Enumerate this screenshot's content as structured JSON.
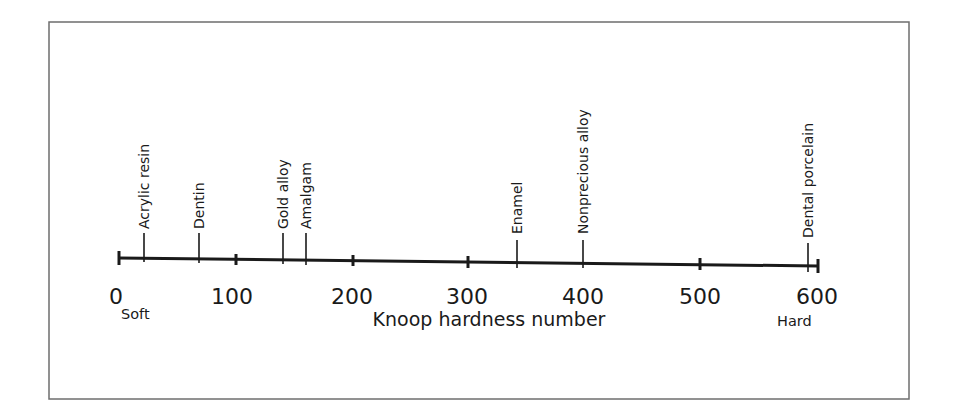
{
  "diagram": {
    "axis_title": "Knoop hardness number",
    "soft_label": "Soft",
    "hard_label": "Hard",
    "scale": {
      "min": 0,
      "max": 600
    },
    "ticks": [
      "0",
      "100",
      "200",
      "300",
      "400",
      "500",
      "600"
    ],
    "materials": [
      {
        "name": "Acrylic resin",
        "value": 21
      },
      {
        "name": "Dentin",
        "value": 68
      },
      {
        "name": "Gold alloy",
        "value": 141
      },
      {
        "name": "Amalgam",
        "value": 160
      },
      {
        "name": "Enamel",
        "value": 343
      },
      {
        "name": "Nonprecious alloy",
        "value": 400
      },
      {
        "name": "Dental porcelain",
        "value": 592
      }
    ]
  }
}
